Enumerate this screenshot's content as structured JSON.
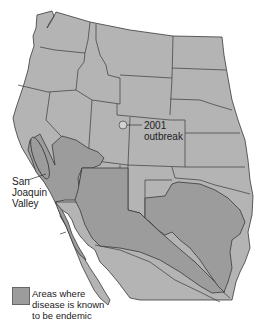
{
  "map": {
    "title": "",
    "region": "Western United States and northern Mexico",
    "colors": {
      "land": "#b4b4b4",
      "endemic": "#9c9c9c",
      "border": "#3a3a3a",
      "background": "#ffffff"
    }
  },
  "annotations": {
    "outbreak": {
      "year": "2001",
      "text": "outbreak"
    },
    "valley": {
      "line1": "San",
      "line2": "Joaquin",
      "line3": "Valley"
    }
  },
  "legend": {
    "line1": "Areas where",
    "line2": "disease is known",
    "line3": "to be endemic"
  }
}
